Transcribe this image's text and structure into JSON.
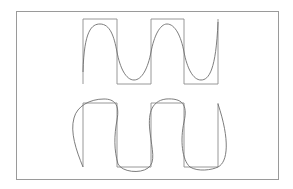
{
  "diagram": {
    "colors": {
      "background": "#ffffff",
      "frame": "#9a9a9a",
      "square_wave": "#8c8c8c",
      "approx_curve": "#6e6e6e"
    },
    "frame": {
      "x": 16,
      "y": 11,
      "width": 262,
      "height": 168
    },
    "top_wave": {
      "square_path": "M83,84 L83,19 L117,19 L117,84 L151,84 L151,19 L184,19 L184,84 L218,84 L218,19",
      "curve_path": "M83,72 C84,30 92,24 100,24 C110,24 114,36 117,52 C120,68 126,80 134,80 C142,80 148,68 151,52 C154,36 160,24 167,24 C175,24 181,36 184,52 C187,68 193,80 201,80 C209,80 216,70 218,22"
    },
    "bottom_wave": {
      "square_path": "M83,167 L83,103 L117,103 L117,167 L151,167 L151,103 L184,103 L184,167 L218,167 L218,103",
      "curve_path": "M83,167 C76,150 70,132 74,118 C77,106 90,99 104,99 C114,99 120,104 117,120 C114,136 114,150 118,164 C122,172 140,174 148,168 C156,162 152,150 150,132 C148,116 150,101 166,99 C182,98 188,104 184,122 C180,140 182,160 190,167 C198,172 212,170 218,167 C228,162 230,140 218,104"
    }
  }
}
